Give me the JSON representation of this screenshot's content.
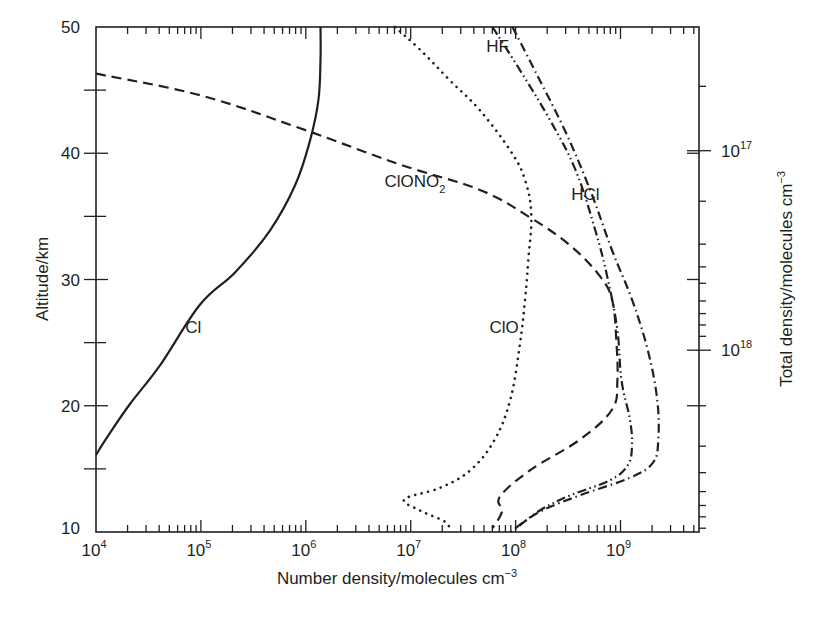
{
  "chart_data": {
    "type": "line",
    "title": "",
    "xlabel": "Number density/molecules cm",
    "xlabel_superscript": "−3",
    "ylabel": "Altitude/km",
    "y2label": "Total density/molecules cm",
    "y2label_superscript": "−3",
    "x_scale": "log",
    "xlim_log10": [
      4,
      9.75
    ],
    "ylim": [
      10,
      50
    ],
    "grid": false,
    "legend": "inline curve labels",
    "x_ticks": [
      {
        "base": "10",
        "exp": "4",
        "log10": 4
      },
      {
        "base": "10",
        "exp": "5",
        "log10": 5
      },
      {
        "base": "10",
        "exp": "6",
        "log10": 6
      },
      {
        "base": "10",
        "exp": "7",
        "log10": 7
      },
      {
        "base": "10",
        "exp": "8",
        "log10": 8
      },
      {
        "base": "10",
        "exp": "9",
        "log10": 9
      }
    ],
    "y_ticks": [
      10,
      20,
      30,
      40,
      50
    ],
    "y2_ticks": [
      {
        "base": "10",
        "exp": "17",
        "altitude_km": 40.2
      },
      {
        "base": "10",
        "exp": "18",
        "altitude_km": 24.4
      }
    ],
    "y2_minor_tick_altitudes_km": [
      45.3,
      36.2,
      32.8,
      31.0,
      29.7,
      28.3,
      27.3,
      26.4,
      25.5,
      20.0,
      16.8,
      14.7,
      13.2,
      12.1,
      11.2,
      10.3
    ],
    "series": [
      {
        "name": "Cl",
        "style": "solid",
        "label": {
          "text": "Cl",
          "x_log10": 4.85,
          "km": 25.8
        },
        "points_log10x_km": [
          [
            4.0,
            16.1
          ],
          [
            4.09,
            17.3
          ],
          [
            4.32,
            20.1
          ],
          [
            4.61,
            23.2
          ],
          [
            4.99,
            28.0
          ],
          [
            5.33,
            30.6
          ],
          [
            5.66,
            33.9
          ],
          [
            5.9,
            37.5
          ],
          [
            6.04,
            41.0
          ],
          [
            6.12,
            44.2
          ],
          [
            6.14,
            47.4
          ],
          [
            6.14,
            50.0
          ]
        ]
      },
      {
        "name": "ClONO2",
        "style": "dashed",
        "label": {
          "text": "ClONO",
          "sub": "2",
          "x_log10": 6.75,
          "km": 37.3
        },
        "points_log10x_km": [
          [
            4.0,
            46.3
          ],
          [
            4.99,
            44.6
          ],
          [
            5.94,
            42.0
          ],
          [
            6.9,
            39.1
          ],
          [
            7.66,
            37.1
          ],
          [
            8.14,
            34.9
          ],
          [
            8.52,
            32.7
          ],
          [
            8.8,
            30.3
          ],
          [
            8.92,
            28.4
          ],
          [
            8.96,
            25.2
          ],
          [
            8.97,
            22.0
          ],
          [
            8.92,
            19.7
          ],
          [
            8.61,
            17.3
          ],
          [
            8.14,
            14.9
          ],
          [
            7.85,
            12.8
          ],
          [
            7.87,
            11.6
          ],
          [
            7.78,
            10.3
          ]
        ]
      },
      {
        "name": "ClO",
        "style": "dotted",
        "label": {
          "text": "ClO",
          "x_log10": 7.75,
          "km": 25.8
        },
        "points_log10x_km": [
          [
            6.85,
            50.0
          ],
          [
            7.09,
            48.2
          ],
          [
            7.37,
            45.8
          ],
          [
            7.66,
            43.4
          ],
          [
            7.95,
            40.2
          ],
          [
            8.09,
            37.9
          ],
          [
            8.15,
            35.1
          ],
          [
            8.12,
            31.5
          ],
          [
            8.09,
            28.4
          ],
          [
            8.04,
            24.8
          ],
          [
            7.95,
            20.5
          ],
          [
            7.8,
            17.3
          ],
          [
            7.57,
            14.9
          ],
          [
            7.28,
            13.5
          ],
          [
            6.94,
            12.6
          ],
          [
            7.09,
            11.7
          ],
          [
            7.33,
            10.8
          ],
          [
            7.37,
            10.1
          ]
        ]
      },
      {
        "name": "HF",
        "style": "dash-dot-dot",
        "label": {
          "text": "HF",
          "x_log10": 7.72,
          "km": 48.0
        },
        "points_log10x_km": [
          [
            7.78,
            50.0
          ],
          [
            8.04,
            46.6
          ],
          [
            8.33,
            42.6
          ],
          [
            8.57,
            38.7
          ],
          [
            8.76,
            33.9
          ],
          [
            8.88,
            30.0
          ],
          [
            8.97,
            26.0
          ],
          [
            9.01,
            22.0
          ],
          [
            9.09,
            18.9
          ],
          [
            9.11,
            16.9
          ],
          [
            9.07,
            15.3
          ],
          [
            8.9,
            14.1
          ],
          [
            8.52,
            12.9
          ],
          [
            8.23,
            11.7
          ],
          [
            7.99,
            10.2
          ]
        ]
      },
      {
        "name": "HCl",
        "style": "dash-dot",
        "label": {
          "text": "HCl",
          "x_log10": 8.53,
          "km": 36.3
        },
        "points_log10x_km": [
          [
            7.97,
            50.0
          ],
          [
            8.18,
            46.6
          ],
          [
            8.47,
            41.8
          ],
          [
            8.71,
            37.1
          ],
          [
            8.92,
            32.3
          ],
          [
            9.11,
            28.4
          ],
          [
            9.26,
            24.4
          ],
          [
            9.35,
            20.5
          ],
          [
            9.36,
            17.3
          ],
          [
            9.31,
            15.5
          ],
          [
            9.09,
            14.3
          ],
          [
            8.61,
            12.9
          ],
          [
            8.23,
            11.6
          ],
          [
            7.95,
            10.0
          ]
        ]
      }
    ]
  },
  "colors": {
    "ink": "#231f20",
    "background": "#ffffff"
  }
}
